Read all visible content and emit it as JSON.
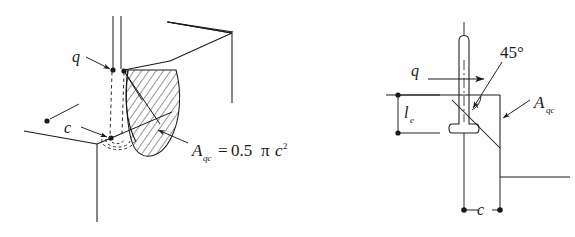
{
  "figure": {
    "background_color": "#fefefe",
    "line_color": "#1a1a1a",
    "hatch_color": "#1a1a1a"
  },
  "left_diagram": {
    "name": "isometric-view",
    "labels": {
      "load_q": "q",
      "edge_distance_c": "c",
      "area_symbol": "A",
      "area_subscript": "qc",
      "equals": "=",
      "value": "0.5",
      "pi": "π",
      "c_var": "c",
      "exponent": "2",
      "formula_full": "A_qc = 0.5 π c²"
    }
  },
  "right_diagram": {
    "name": "section-view",
    "labels": {
      "load_q": "q",
      "angle": "45°",
      "embed_length": "l",
      "embed_length_sub": "e",
      "area_symbol": "A",
      "area_subscript": "qc",
      "edge_distance_c": "c"
    }
  }
}
